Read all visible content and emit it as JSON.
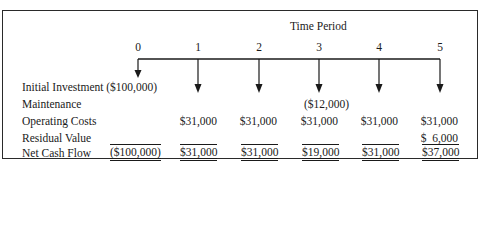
{
  "title": "Time Period",
  "periods": [
    "0",
    "1",
    "2",
    "3",
    "4",
    "5"
  ],
  "rows": [
    {
      "label": "Initial Investment",
      "values": [
        "($100,000)",
        "",
        "",
        "",
        "",
        ""
      ]
    },
    {
      "label": "Maintenance",
      "values": [
        "",
        "",
        "",
        "($12,000)",
        "",
        ""
      ]
    },
    {
      "label": "Operating Costs",
      "values": [
        "",
        "$31,000",
        "$31,000",
        "$31,000",
        "$31,000",
        "$31,000"
      ]
    },
    {
      "label": "Residual Value",
      "values": [
        "",
        "",
        "",
        "",
        "",
        "$  6,000"
      ]
    },
    {
      "label": "Net Cash Flow",
      "values": [
        "($100,000)",
        "$31,000",
        "$31,000",
        "$19,000",
        "$31,000",
        "$37,000"
      ]
    }
  ]
}
